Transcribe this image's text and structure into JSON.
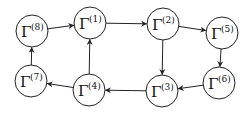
{
  "diagram": {
    "type": "directed-graph",
    "nodes": [
      {
        "id": "1",
        "symbol": "Γ",
        "sup": "(1)",
        "x": 90,
        "y": 23
      },
      {
        "id": "2",
        "symbol": "Γ",
        "sup": "(2)",
        "x": 163,
        "y": 24
      },
      {
        "id": "3",
        "symbol": "Γ",
        "sup": "(3)",
        "x": 162,
        "y": 91
      },
      {
        "id": "4",
        "symbol": "Γ",
        "sup": "(4)",
        "x": 89,
        "y": 90
      },
      {
        "id": "5",
        "symbol": "Γ",
        "sup": "(5)",
        "x": 222,
        "y": 33
      },
      {
        "id": "6",
        "symbol": "Γ",
        "sup": "(6)",
        "x": 219,
        "y": 83
      },
      {
        "id": "7",
        "symbol": "Γ",
        "sup": "(7)",
        "x": 31,
        "y": 81
      },
      {
        "id": "8",
        "symbol": "Γ",
        "sup": "(8)",
        "x": 32,
        "y": 31
      }
    ],
    "edges": [
      {
        "from": "8",
        "to": "1"
      },
      {
        "from": "1",
        "to": "2"
      },
      {
        "from": "2",
        "to": "5"
      },
      {
        "from": "2",
        "to": "3"
      },
      {
        "from": "5",
        "to": "6"
      },
      {
        "from": "6",
        "to": "3"
      },
      {
        "from": "3",
        "to": "4"
      },
      {
        "from": "4",
        "to": "1"
      },
      {
        "from": "4",
        "to": "7"
      },
      {
        "from": "7",
        "to": "8"
      }
    ],
    "node_radius": 16,
    "colors": {
      "stroke": "#222222",
      "fill": "#ffffff",
      "text": "#111111"
    }
  }
}
